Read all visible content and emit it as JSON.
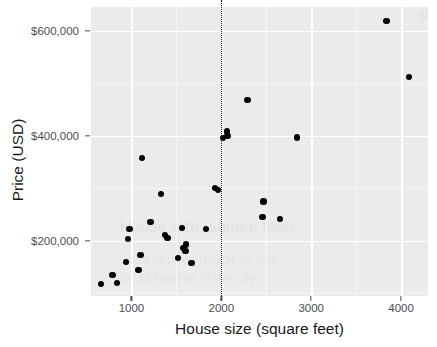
{
  "chart_data": {
    "type": "scatter",
    "title": "",
    "xlabel": "House size (square feet)",
    "ylabel": "Price (USD)",
    "xlim": [
      550,
      4300
    ],
    "ylim": [
      95000,
      645000
    ],
    "x_ticks": [
      1000,
      2000,
      3000,
      4000
    ],
    "x_tick_labels": [
      "1000",
      "2000",
      "3000",
      "4000"
    ],
    "y_ticks": [
      200000,
      400000,
      600000
    ],
    "y_tick_labels": [
      "$200,000",
      "$400,000",
      "$600,000"
    ],
    "grid": true,
    "legend": "none",
    "point_color": "#000000",
    "panel_background": "#ebebeb",
    "gridline_color": "#ffffff",
    "annotations": [
      {
        "kind": "vertical-reference-line",
        "x": 2000,
        "style": "dotted",
        "color": "#1a1a1a"
      }
    ],
    "points": [
      {
        "x": 660,
        "y": 118000
      },
      {
        "x": 790,
        "y": 135000
      },
      {
        "x": 840,
        "y": 120000
      },
      {
        "x": 940,
        "y": 160000
      },
      {
        "x": 960,
        "y": 203000
      },
      {
        "x": 980,
        "y": 222000
      },
      {
        "x": 1080,
        "y": 145000
      },
      {
        "x": 1100,
        "y": 173000
      },
      {
        "x": 1120,
        "y": 358000
      },
      {
        "x": 1210,
        "y": 236000
      },
      {
        "x": 1330,
        "y": 289000
      },
      {
        "x": 1370,
        "y": 211000
      },
      {
        "x": 1400,
        "y": 205000
      },
      {
        "x": 1520,
        "y": 167000
      },
      {
        "x": 1560,
        "y": 225000
      },
      {
        "x": 1580,
        "y": 186000
      },
      {
        "x": 1600,
        "y": 181000
      },
      {
        "x": 1610,
        "y": 193000
      },
      {
        "x": 1670,
        "y": 158000
      },
      {
        "x": 1830,
        "y": 223000
      },
      {
        "x": 1930,
        "y": 300000
      },
      {
        "x": 1960,
        "y": 297000
      },
      {
        "x": 2020,
        "y": 396000
      },
      {
        "x": 2060,
        "y": 408000
      },
      {
        "x": 2070,
        "y": 400000
      },
      {
        "x": 2290,
        "y": 468000
      },
      {
        "x": 2470,
        "y": 275000
      },
      {
        "x": 2460,
        "y": 245000
      },
      {
        "x": 2650,
        "y": 242000
      },
      {
        "x": 2840,
        "y": 397000
      },
      {
        "x": 3840,
        "y": 618000
      },
      {
        "x": 4090,
        "y": 512000
      }
    ]
  },
  "ghost_artifacts": [
    {
      "text": "House size (square feet)",
      "left": 120,
      "top": 218,
      "size": 16
    },
    {
      "text": "$USD",
      "left": 418,
      "top": 8,
      "size": 14
    },
    {
      "text": "plot of price (USD) vs size",
      "left": 128,
      "top": 252,
      "size": 13
    },
    {
      "text": "for 32 houses in the city",
      "left": 118,
      "top": 270,
      "size": 13
    }
  ]
}
